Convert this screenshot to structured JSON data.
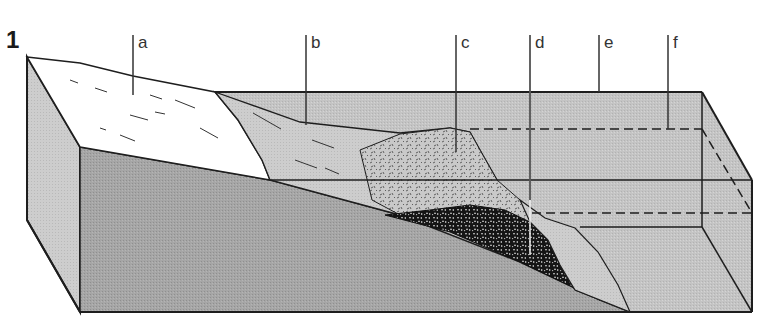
{
  "figure": {
    "number": "1",
    "type": "block diagram cross-section"
  },
  "labels": [
    {
      "id": "a",
      "text": "a"
    },
    {
      "id": "b",
      "text": "b"
    },
    {
      "id": "c",
      "text": "c"
    },
    {
      "id": "d",
      "text": "d"
    },
    {
      "id": "e",
      "text": "e"
    },
    {
      "id": "f",
      "text": "f"
    }
  ],
  "colors": {
    "background": "#ffffff",
    "outline": "#1e1e1e",
    "front_face": "#a4a4a4",
    "side_face": "#d2d2d2",
    "water_body": "#c6c6c6",
    "snow_surface": "#ffffff",
    "gravel_dark": "#1a1a1a",
    "sediment_light": "#cfcfcf"
  }
}
